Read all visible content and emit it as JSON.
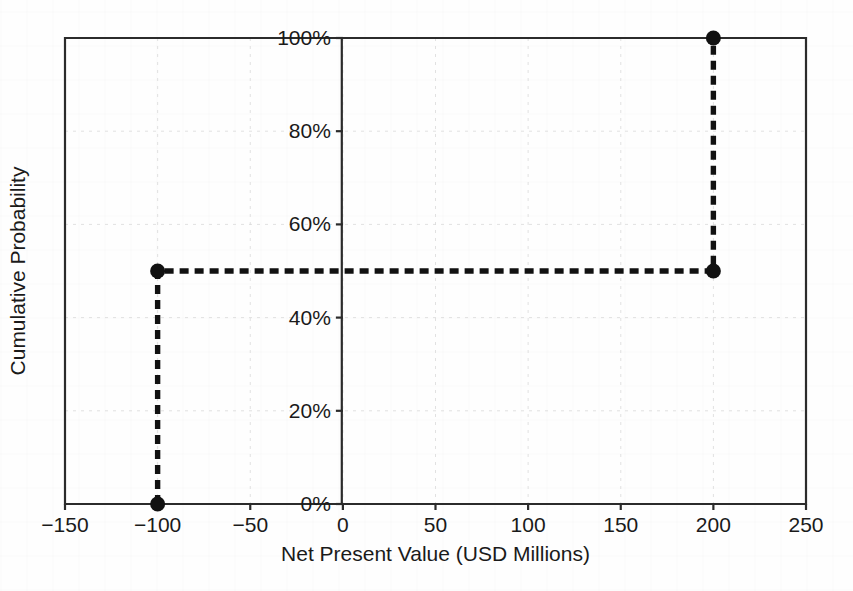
{
  "chart_data": {
    "type": "line",
    "subtype": "step-cdf",
    "title": "",
    "xlabel": "Net Present Value (USD Millions)",
    "ylabel": "Cumulative Probability",
    "xlim": [
      -150,
      250
    ],
    "ylim": [
      0,
      100
    ],
    "grid": true,
    "legend": null,
    "x_ticks": [
      -150,
      -100,
      -50,
      0,
      50,
      100,
      150,
      200,
      250
    ],
    "x_tick_labels": [
      "−150",
      "−100",
      "−50",
      "0",
      "50",
      "100",
      "150",
      "200",
      "250"
    ],
    "y_ticks": [
      0,
      20,
      40,
      60,
      80,
      100
    ],
    "y_tick_labels": [
      "0%",
      "20%",
      "40%",
      "60%",
      "80%",
      "100%"
    ],
    "series": [
      {
        "name": "Cumulative Probability",
        "style": "dashed",
        "color": "#111111",
        "marker": "circle",
        "points": [
          {
            "x": -100,
            "y": 0
          },
          {
            "x": -100,
            "y": 50
          },
          {
            "x": 200,
            "y": 50
          },
          {
            "x": 200,
            "y": 100
          }
        ]
      }
    ],
    "outcomes": [
      {
        "npv": -100,
        "cumulative_probability": 50
      },
      {
        "npv": 200,
        "cumulative_probability": 100
      }
    ]
  },
  "axes": {
    "x_title": "Net Present Value (USD Millions)",
    "y_title": "Cumulative Probability"
  }
}
